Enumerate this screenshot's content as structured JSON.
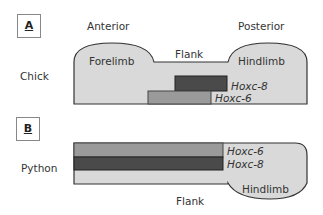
{
  "panels": [
    {
      "label": "A",
      "organism": "Chick",
      "region_labels": {
        "anterior": "Anterior",
        "posterior": "Posterior",
        "forelimb": "Forelimb",
        "flank": "Flank",
        "hindlimb": "Hindlimb"
      },
      "genes": [
        {
          "name": "Hoxc-8",
          "color": "#4a4a4a"
        },
        {
          "name": "Hoxc-6",
          "color": "#9a9a9a"
        }
      ]
    },
    {
      "label": "B",
      "organism": "Python",
      "region_labels": {
        "flank": "Flank",
        "hindlimb": "Hindlimb"
      },
      "genes": [
        {
          "name": "Hoxc-6",
          "color": "#9a9a9a"
        },
        {
          "name": "Hoxc-8",
          "color": "#4a4a4a"
        }
      ]
    }
  ],
  "colors": {
    "body": "#d9d9d9",
    "outline": "#333333"
  }
}
